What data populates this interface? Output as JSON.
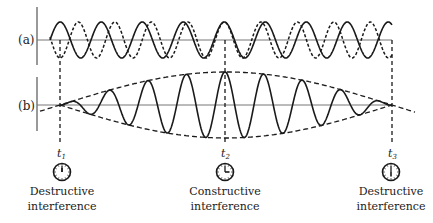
{
  "figure": {
    "panels": [
      {
        "id": "a",
        "label": "(a)",
        "description": "Two component waves of slightly different frequency (solid and dashed)"
      },
      {
        "id": "b",
        "label": "(b)",
        "description": "Superposition showing beat pattern with dashed envelope"
      }
    ],
    "markers": [
      {
        "id": "t1",
        "label": "t",
        "sub": "1",
        "x": 60,
        "clock": "12:00",
        "caption_line1": "Destructive",
        "caption_line2": "interference"
      },
      {
        "id": "t2",
        "label": "t",
        "sub": "2",
        "x": 225,
        "clock": "3:00",
        "caption_line1": "Constructive",
        "caption_line2": "interference"
      },
      {
        "id": "t3",
        "label": "t",
        "sub": "3",
        "x": 392,
        "clock": "6:00",
        "caption_line1": "Destructive",
        "caption_line2": "interference"
      }
    ],
    "waves": {
      "solid_period_px": 41,
      "dashed_period_px": 36.5,
      "amplitude_a_px": 18,
      "max_amplitude_b_px": 33,
      "x_start": 50,
      "x_end": 392
    },
    "colors": {
      "ink": "#1a1a1a",
      "axis": "#6b6b6b"
    }
  }
}
